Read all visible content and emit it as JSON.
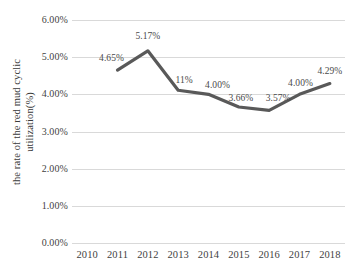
{
  "chart_data": {
    "type": "line",
    "title": "",
    "xlabel": "",
    "ylabel": "the rate of the red mud cyclic utilization(%)",
    "ylabel_line1": "the rate of the red mud cyclic",
    "ylabel_line2": "utilization(%)",
    "categories": [
      "2010",
      "2011",
      "2012",
      "2013",
      "2014",
      "2015",
      "2016",
      "2017",
      "2018"
    ],
    "x_tick_labels": [
      "2010",
      "2011",
      "2012",
      "2013",
      "2014",
      "2015",
      "2016",
      "2017",
      "2018"
    ],
    "y_tick_labels": [
      "6.00%",
      "5.00%",
      "4.00%",
      "3.00%",
      "2.00%",
      "1.00%",
      "0.00%"
    ],
    "y_tick_values": [
      6.0,
      5.0,
      4.0,
      3.0,
      2.0,
      1.0,
      0.0
    ],
    "ylim": [
      0.0,
      6.0
    ],
    "grid": true,
    "grid_axis": "y",
    "legend": false,
    "legend_position": "none",
    "markers": false,
    "series": [
      {
        "name": "the rate of the red mud cyclic utilization(%)",
        "color": "#595959",
        "x": [
          "2011",
          "2012",
          "2013",
          "2014",
          "2015",
          "2016",
          "2017",
          "2018"
        ],
        "values": [
          4.65,
          5.17,
          4.11,
          4.0,
          3.66,
          3.57,
          4.0,
          4.29
        ]
      }
    ],
    "point_labels": [
      {
        "category": "2011",
        "text": "4.65%",
        "value": 4.65
      },
      {
        "category": "2012",
        "text": "5.17%",
        "value": 5.17
      },
      {
        "category": "2013",
        "text": "11%",
        "value": 4.11
      },
      {
        "category": "2014",
        "text": "4.00%",
        "value": 4.0
      },
      {
        "category": "2015",
        "text": "3.66%",
        "value": 3.66
      },
      {
        "category": "2016",
        "text": "3.57%",
        "value": 3.57
      },
      {
        "category": "2017",
        "text": "4.00%",
        "value": 4.0
      },
      {
        "category": "2018",
        "text": "4.29%",
        "value": 4.29
      }
    ],
    "colors": {
      "line": "#595959",
      "gridline": "#d9d9d9",
      "text": "#3f3f3f",
      "background": "#ffffff"
    }
  }
}
